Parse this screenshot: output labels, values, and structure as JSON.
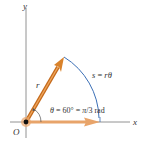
{
  "diagram": {
    "axes": {
      "x_label": "x",
      "y_label": "y",
      "origin_label": "O"
    },
    "vectors": {
      "radius_label": "r",
      "radius_color": "#d9822b",
      "baseline_color": "#e8a46a"
    },
    "arc": {
      "label_s": "s",
      "label_eq": " = ",
      "label_r": "r",
      "label_theta": "θ",
      "color": "#3b6fb6"
    },
    "angle": {
      "theta": "θ",
      "eq1": " = 60° = ",
      "pi": "π",
      "frac": "/3 rad"
    },
    "colors": {
      "axis": "#555555",
      "text": "#333333"
    }
  }
}
